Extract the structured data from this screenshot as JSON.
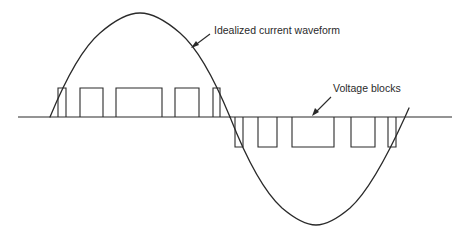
{
  "diagram": {
    "labels": {
      "current": "Idealized current waveform",
      "voltage": "Voltage blocks"
    },
    "colors": {
      "line": "#2a2a2a",
      "background": "#ffffff"
    },
    "baseline": {
      "y": 117,
      "x1": 18,
      "x2": 452
    },
    "positive_blocks": [
      {
        "x1": 58,
        "x2": 66
      },
      {
        "x1": 80,
        "x2": 103
      },
      {
        "x1": 116,
        "x2": 162
      },
      {
        "x1": 175,
        "x2": 199
      },
      {
        "x1": 213,
        "x2": 220
      }
    ],
    "negative_blocks": [
      {
        "x1": 235,
        "x2": 243
      },
      {
        "x1": 258,
        "x2": 277
      },
      {
        "x1": 292,
        "x2": 334
      },
      {
        "x1": 351,
        "x2": 375
      },
      {
        "x1": 388,
        "x2": 396
      }
    ],
    "block_heights": {
      "positive_top": 88,
      "negative_bottom": 147
    }
  }
}
